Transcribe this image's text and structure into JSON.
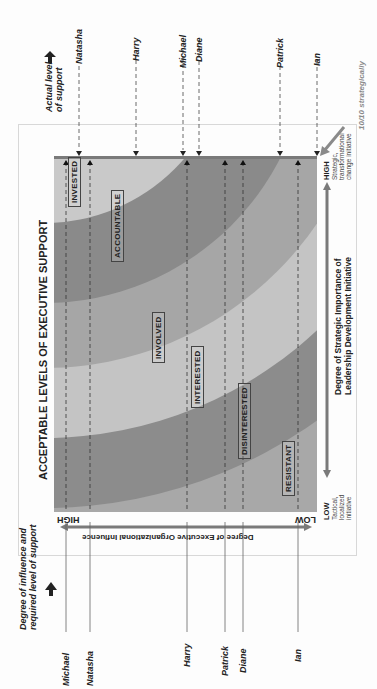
{
  "figure": {
    "title": "ACCEPTABLE LEVELS OF EXECUTIVE SUPPORT",
    "left_header": [
      "Degree of influence and",
      "required level of support"
    ],
    "right_header": [
      "Actual level",
      "of support"
    ],
    "annotation": "10/10 strategically",
    "influence_axis": {
      "label": "Degree of Executive Organizational Influence",
      "high": "HIGH",
      "low": "LOW"
    },
    "strategic_axis": {
      "label_line1": "Degree of Strategic Importance of",
      "label_line2": "Leadership Development Initiative",
      "low": "LOW",
      "low_desc": [
        "Tactical,",
        "localized",
        "initiative"
      ],
      "high": "HIGH",
      "high_desc": [
        "Strategic,",
        "transformational",
        "change initiative"
      ]
    },
    "zones": [
      "INVESTED",
      "ACCOUNTABLE",
      "INVOLVED",
      "INTERESTED",
      "DISINTERESTED",
      "RESISTANT"
    ],
    "required_support": [
      "Michael",
      "Natasha",
      "Harry",
      "Patrick",
      "Diane",
      "Ian"
    ],
    "actual_support": [
      "Natasha",
      "Harry",
      "Michael",
      "Diane",
      "Patrick",
      "Ian"
    ],
    "colors": {
      "band_light": "#c9c9c9",
      "band_dark": "#8d8d8d",
      "band_mid": "#a9a9a9",
      "axis_bar": "#7a7a7a",
      "annotation": "#8a8a8a"
    }
  }
}
